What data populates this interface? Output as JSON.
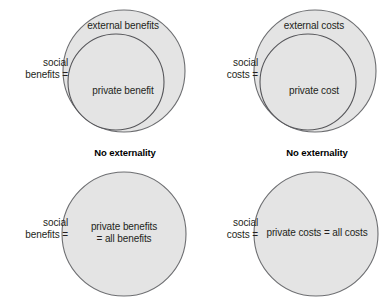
{
  "diagram": {
    "type": "venn-nested-circles",
    "background_color": "#ffffff",
    "circle_fill": "#e4e4e4",
    "circle_stroke": "#6d6e71",
    "text_color": "#231f20"
  },
  "quadrants": {
    "top_left": {
      "side_label": "social\nbenefits =",
      "outer_circle_label": "external benefits",
      "inner_circle_label": "private benefit"
    },
    "top_right": {
      "side_label": "social\ncosts =",
      "outer_circle_label": "external costs",
      "inner_circle_label": "private cost"
    },
    "bottom_left": {
      "caption": "No externality",
      "side_label": "social\nbenefits =",
      "circle_label": "private benefits\n= all benefits"
    },
    "bottom_right": {
      "caption": "No externality",
      "side_label": "social\ncosts =",
      "circle_label": "private costs = all costs"
    }
  }
}
